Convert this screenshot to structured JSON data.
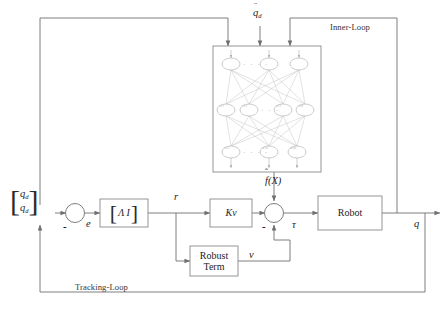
{
  "diagram": {
    "loops": {
      "inner": "Inner-Loop",
      "tracking": "Tracking-Loop"
    },
    "signals": {
      "desired_accel": "q̈d",
      "error": "e",
      "filtered_error": "r",
      "nn_output": "f̂(X)",
      "torque": "τ",
      "robust_signal": "v",
      "output": "q"
    },
    "input_vector": {
      "row1": "q",
      "row1_sub": "d",
      "row2": "q",
      "row2_sub": "d",
      "left_bracket": "[",
      "right_bracket": "]"
    },
    "blocks": {
      "gain_matrix": {
        "label": "Λ  I",
        "left_bracket": "[",
        "right_bracket": "]"
      },
      "kv": {
        "base": "K",
        "sub": "v"
      },
      "robust": {
        "line1": "Robust",
        "line2": "Term"
      },
      "plant": {
        "label": "Robot"
      },
      "neural_net": {
        "label": ""
      }
    },
    "summing_junctions": [
      {
        "name": "error-junction",
        "sign": "-"
      },
      {
        "name": "torque-junction",
        "sign": "-"
      }
    ],
    "neural_network": {
      "layers": [
        {
          "name": "input-layer",
          "nodes": [
            "x1",
            "x2",
            "xn"
          ],
          "ellipsis": "· · · ·"
        },
        {
          "name": "hidden-layer",
          "nodes": [
            "v11",
            "v12",
            "v21",
            "vnh"
          ],
          "ellipsis": "· · ·"
        },
        {
          "name": "output-layer",
          "nodes": [
            "w11",
            "w1h",
            "wnh"
          ],
          "ellipsis": "· · · ·"
        }
      ]
    },
    "colors": {
      "line": "#6f6f6f",
      "node_stroke": "#b4b4b4",
      "edge": "#bdbdbd",
      "box_stroke": "#8a8a8a",
      "text": "#1d1d1d"
    }
  }
}
